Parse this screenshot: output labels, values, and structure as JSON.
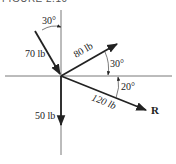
{
  "header": {
    "text": "FIGURE 2.10"
  },
  "diagram": {
    "origin": [
      61,
      76
    ],
    "forces": [
      {
        "name": "force-70",
        "label": "70 lb",
        "magnitude": 70,
        "unit": "lb",
        "angle_label": "30°",
        "angle_ref": "from vertical, pointing toward origin"
      },
      {
        "name": "force-80",
        "label": "80 lb",
        "magnitude": 80,
        "unit": "lb",
        "angle_label": "30°",
        "angle_ref": "above horizontal"
      },
      {
        "name": "force-120",
        "label": "120 lb",
        "magnitude": 120,
        "unit": "lb",
        "angle_label": "20°",
        "angle_ref": "below horizontal"
      },
      {
        "name": "force-50",
        "label": "50 lb",
        "magnitude": 50,
        "unit": "lb",
        "angle_label": "",
        "angle_ref": "straight down"
      }
    ],
    "resultant_label": "R",
    "colors": {
      "line": "#222222",
      "axis": "#555555"
    }
  }
}
